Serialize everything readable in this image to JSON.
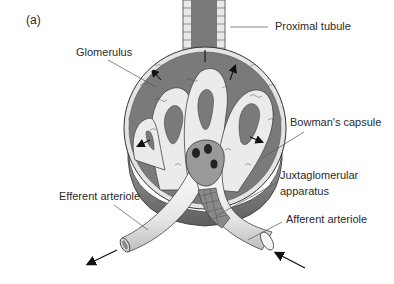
{
  "figure": {
    "panel_label": "(a)",
    "labels": {
      "glomerulus": "Glomerulus",
      "proximal_tubule": "Proximal tubule",
      "bowmans_capsule": "Bowman's capsule",
      "juxtaglomerular_line1": "Juxtaglomerular",
      "juxtaglomerular_line2": "apparatus",
      "efferent_arteriole": "Efferent arteriole",
      "afferent_arteriole": "Afferent arteriole"
    },
    "colors": {
      "capsule_space": "#7a7a7a",
      "capillary": "#e8e8e8",
      "outline": "#333333",
      "text": "#2a2a2a",
      "vessel": "#efefef"
    }
  }
}
